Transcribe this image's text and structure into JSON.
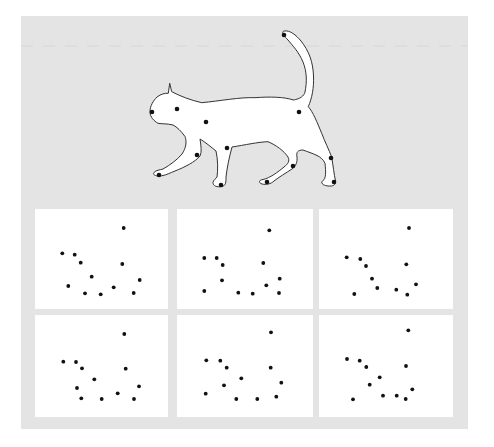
{
  "figure": {
    "background_color": "#e4e4e4",
    "panel_color": "#ffffff",
    "dot_color": "#111111",
    "outline_color": "#333333"
  },
  "cat": {
    "description": "walking cat silhouette with keypoint markers",
    "keypoints": [
      {
        "name": "tail-tip",
        "x": 284,
        "y": 35
      },
      {
        "name": "nose",
        "x": 152,
        "y": 112
      },
      {
        "name": "eye",
        "x": 177,
        "y": 109
      },
      {
        "name": "shoulder",
        "x": 206,
        "y": 122
      },
      {
        "name": "hip",
        "x": 299,
        "y": 112
      },
      {
        "name": "front-elbow",
        "x": 227,
        "y": 148
      },
      {
        "name": "rear-front-knee",
        "x": 197,
        "y": 155
      },
      {
        "name": "front-paw-left",
        "x": 159,
        "y": 175
      },
      {
        "name": "front-paw-right",
        "x": 221,
        "y": 185
      },
      {
        "name": "back-knee",
        "x": 293,
        "y": 166
      },
      {
        "name": "back-paw-left",
        "x": 267,
        "y": 182
      },
      {
        "name": "back-hock",
        "x": 331,
        "y": 158
      },
      {
        "name": "back-paw-right",
        "x": 334,
        "y": 182
      }
    ]
  },
  "panels": [
    {
      "x": 35,
      "y": 209,
      "w": 133,
      "h": 100,
      "dots": [
        [
          123.7,
          228
        ],
        [
          62.3,
          253.3
        ],
        [
          74.7,
          254.7
        ],
        [
          80.7,
          262.7
        ],
        [
          122.3,
          264
        ],
        [
          91.7,
          276.7
        ],
        [
          139.7,
          280
        ],
        [
          68.3,
          286
        ],
        [
          113.7,
          287.3
        ],
        [
          85,
          293.3
        ],
        [
          100.7,
          294.3
        ],
        [
          133.7,
          293
        ]
      ]
    },
    {
      "x": 177,
      "y": 209,
      "w": 136,
      "h": 100,
      "dots": [
        [
          269.3,
          230.3
        ],
        [
          204.3,
          258
        ],
        [
          216.7,
          258
        ],
        [
          222.7,
          265
        ],
        [
          263.3,
          263
        ],
        [
          222,
          280.3
        ],
        [
          279.7,
          278.7
        ],
        [
          266.3,
          285.3
        ],
        [
          204.3,
          291
        ],
        [
          238.3,
          292.7
        ],
        [
          252.7,
          293.7
        ],
        [
          279,
          293
        ]
      ]
    },
    {
      "x": 319,
      "y": 209,
      "w": 134,
      "h": 100,
      "dots": [
        [
          409,
          228
        ],
        [
          346.7,
          257.3
        ],
        [
          360.3,
          259
        ],
        [
          366,
          266
        ],
        [
          406.3,
          264.3
        ],
        [
          372,
          278.7
        ],
        [
          416,
          284.3
        ],
        [
          377.3,
          288
        ],
        [
          396.3,
          289.7
        ],
        [
          354.3,
          294
        ],
        [
          407.3,
          294.7
        ]
      ]
    },
    {
      "x": 35,
      "y": 315,
      "w": 133,
      "h": 102,
      "dots": [
        [
          124.3,
          334
        ],
        [
          63.3,
          361.7
        ],
        [
          76,
          362
        ],
        [
          82,
          368.3
        ],
        [
          125.7,
          368.7
        ],
        [
          94.3,
          379.3
        ],
        [
          77,
          388
        ],
        [
          139,
          386.3
        ],
        [
          117.7,
          393.3
        ],
        [
          81.3,
          398.3
        ],
        [
          101.7,
          399
        ],
        [
          134,
          399
        ]
      ]
    },
    {
      "x": 177,
      "y": 315,
      "w": 136,
      "h": 102,
      "dots": [
        [
          271,
          332.3
        ],
        [
          206.3,
          360.3
        ],
        [
          220.3,
          360.7
        ],
        [
          226.7,
          367.7
        ],
        [
          270.7,
          367.7
        ],
        [
          241.3,
          378.3
        ],
        [
          281.3,
          382.7
        ],
        [
          224,
          385.3
        ],
        [
          205.7,
          393.7
        ],
        [
          276.3,
          396.7
        ],
        [
          236.3,
          399
        ],
        [
          257.3,
          399
        ]
      ]
    },
    {
      "x": 319,
      "y": 315,
      "w": 134,
      "h": 102,
      "dots": [
        [
          408.3,
          330.3
        ],
        [
          347,
          359
        ],
        [
          359.7,
          360.7
        ],
        [
          366.3,
          367
        ],
        [
          406,
          366
        ],
        [
          379.7,
          377.3
        ],
        [
          369.7,
          384.7
        ],
        [
          412.3,
          389.3
        ],
        [
          383,
          395.7
        ],
        [
          396.7,
          395.7
        ],
        [
          353,
          399.3
        ],
        [
          405.7,
          399
        ]
      ]
    }
  ]
}
